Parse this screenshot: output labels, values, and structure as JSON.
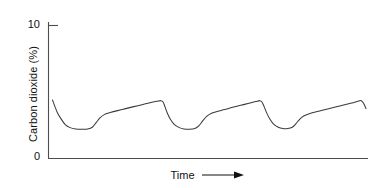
{
  "chart_data": {
    "type": "line",
    "title": "",
    "subtitle": "",
    "xlabel": "Time",
    "ylabel": "Carbon dioxide (%)",
    "xlabel_suffix_icon": "right-arrow-icon",
    "grid": false,
    "legend": null,
    "legend_position": "none",
    "xlim": [
      0,
      100
    ],
    "ylim": [
      0,
      10
    ],
    "ytick_labels": [
      "0",
      "10"
    ],
    "ytick_values": [
      0,
      10
    ],
    "xtick_labels": [],
    "xtick_values": [],
    "axis_color": "#4d4d4d",
    "line_color": "#3a3a3a",
    "background_color": "#ffffff",
    "series": [
      {
        "name": "Carbon dioxide",
        "description": "Repeating sawtooth cycle: sharp exponential fall to a flat trough, then a slow rise to a peak, repeated about 3.5 times.",
        "cycles": 3.5,
        "peak_value": 4.35,
        "trough_value": 2.2,
        "points": [
          [
            1.5,
            4.4
          ],
          [
            2.4,
            3.9
          ],
          [
            3.4,
            3.4
          ],
          [
            4.6,
            3.0
          ],
          [
            6.2,
            2.55
          ],
          [
            8.0,
            2.32
          ],
          [
            10.0,
            2.22
          ],
          [
            12.5,
            2.2
          ],
          [
            14.5,
            2.22
          ],
          [
            16.2,
            2.35
          ],
          [
            17.6,
            2.7
          ],
          [
            19.0,
            3.05
          ],
          [
            20.6,
            3.3
          ],
          [
            22.8,
            3.45
          ],
          [
            25.5,
            3.6
          ],
          [
            28.5,
            3.75
          ],
          [
            31.5,
            3.9
          ],
          [
            34.5,
            4.05
          ],
          [
            37.5,
            4.2
          ],
          [
            40.0,
            4.3
          ],
          [
            41.5,
            4.35
          ],
          [
            42.3,
            4.25
          ],
          [
            43.0,
            3.9
          ],
          [
            43.9,
            3.4
          ],
          [
            45.0,
            2.95
          ],
          [
            46.5,
            2.55
          ],
          [
            48.3,
            2.32
          ],
          [
            50.0,
            2.22
          ],
          [
            52.0,
            2.2
          ],
          [
            54.0,
            2.25
          ],
          [
            55.5,
            2.45
          ],
          [
            57.0,
            2.85
          ],
          [
            58.6,
            3.2
          ],
          [
            60.4,
            3.42
          ],
          [
            62.5,
            3.55
          ],
          [
            65.0,
            3.68
          ],
          [
            68.0,
            3.85
          ],
          [
            71.0,
            4.0
          ],
          [
            74.0,
            4.15
          ],
          [
            76.5,
            4.28
          ],
          [
            78.0,
            4.35
          ],
          [
            78.8,
            4.25
          ],
          [
            79.6,
            3.9
          ],
          [
            80.5,
            3.45
          ],
          [
            81.6,
            3.0
          ],
          [
            83.0,
            2.6
          ],
          [
            84.8,
            2.35
          ],
          [
            86.5,
            2.25
          ],
          [
            88.3,
            2.25
          ],
          [
            90.0,
            2.35
          ],
          [
            91.3,
            2.6
          ],
          [
            92.7,
            2.95
          ],
          [
            94.2,
            3.2
          ],
          [
            96.0,
            3.35
          ],
          [
            98.5,
            3.5
          ],
          [
            101.5,
            3.65
          ],
          [
            104.5,
            3.8
          ],
          [
            107.5,
            3.95
          ],
          [
            110.0,
            4.08
          ],
          [
            112.5,
            4.2
          ],
          [
            114.5,
            4.32
          ],
          [
            115.5,
            4.35
          ],
          [
            116.3,
            4.15
          ],
          [
            117.2,
            3.75
          ]
        ]
      }
    ]
  },
  "axes": {
    "y_tick_ten": "10",
    "y_tick_zero": "0",
    "y_title": "Carbon dioxide (%)",
    "x_title": "Time"
  }
}
